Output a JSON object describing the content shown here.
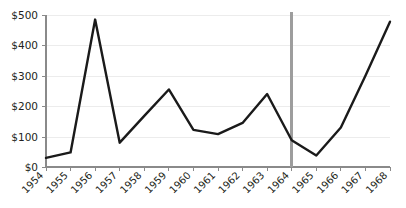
{
  "chart_data": {
    "type": "line",
    "title": "",
    "subtitle": "",
    "xlabel": "",
    "ylabel": "",
    "categories": [
      "1954",
      "1955",
      "1956",
      "1957",
      "1958",
      "1959",
      "1960",
      "1961",
      "1962",
      "1963",
      "1964",
      "1965",
      "1966",
      "1967",
      "1968"
    ],
    "values": [
      30,
      48,
      485,
      80,
      168,
      255,
      122,
      108,
      145,
      240,
      88,
      38,
      130,
      300,
      478
    ],
    "series": [
      {
        "name": "",
        "values": [
          30,
          48,
          485,
          80,
          168,
          255,
          122,
          108,
          145,
          240,
          88,
          38,
          130,
          300,
          478
        ]
      }
    ],
    "ylim": [
      0,
      500
    ],
    "ytick_values": [
      0,
      100,
      200,
      300,
      400,
      500
    ],
    "ytick_labels": [
      "$0",
      "$100",
      "$200",
      "$300",
      "$400",
      "$500"
    ],
    "xtick_labels": [
      "1954",
      "1955",
      "1956",
      "1957",
      "1958",
      "1959",
      "1960",
      "1961",
      "1962",
      "1963",
      "1964",
      "1965",
      "1966",
      "1967",
      "1968"
    ],
    "xtick_label_rotation": "-45",
    "grid": true,
    "grid_axis": "y",
    "legend": false,
    "legend_position": "none",
    "annotations": [
      {
        "type": "vertical-reference-line",
        "at_category": "1964",
        "label": "",
        "color": "#9d9d9d"
      }
    ],
    "colors": {
      "line": "#1a1a1a",
      "grid": "#ececec",
      "axis": "#8a8a8a",
      "marker_line": "#9d9d9d",
      "background": "#ffffff",
      "text": "#231f20"
    }
  }
}
